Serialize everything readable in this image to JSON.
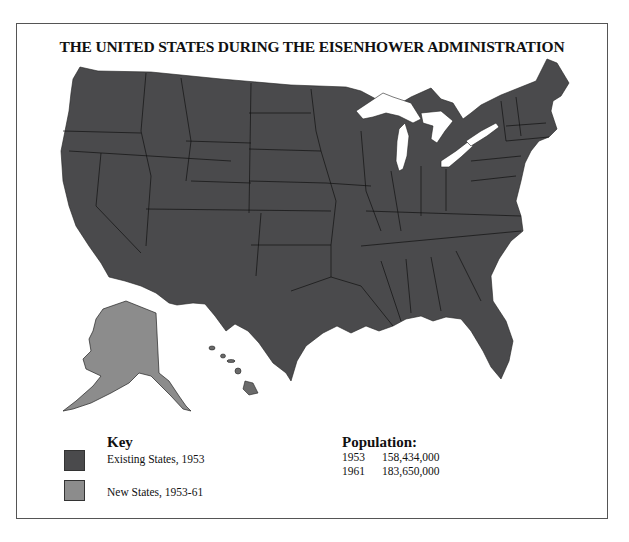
{
  "title": "THE UNITED STATES DURING THE EISENHOWER ADMINISTRATION",
  "colors": {
    "existing_states": "#4a4a4c",
    "new_states": "#8c8c8c",
    "lakes": "#ffffff",
    "border": "#111111"
  },
  "map": {
    "regions": [
      {
        "name": "Contiguous United States",
        "category": "Existing States, 1953"
      },
      {
        "name": "Alaska",
        "category": "New States, 1953-61"
      },
      {
        "name": "Hawaii",
        "category": "New States, 1953-61"
      }
    ]
  },
  "key": {
    "title": "Key",
    "items": [
      {
        "label": "Existing States, 1953",
        "color": "#4a4a4c"
      },
      {
        "label": "New States, 1953-61",
        "color": "#8c8c8c"
      }
    ]
  },
  "population": {
    "title": "Population:",
    "rows": [
      {
        "year": "1953",
        "value": "158,434,000"
      },
      {
        "year": "1961",
        "value": "183,650,000"
      }
    ]
  }
}
